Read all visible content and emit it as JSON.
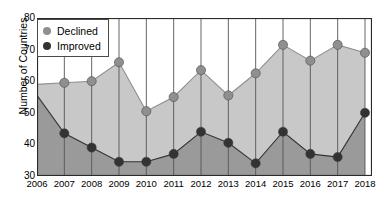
{
  "chart_data": {
    "type": "area",
    "title": "",
    "xlabel": "",
    "ylabel": "Number of Countries",
    "categories": [
      "2006",
      "2007",
      "2008",
      "2009",
      "2010",
      "2011",
      "2012",
      "2013",
      "2014",
      "2015",
      "2016",
      "2017",
      "2018"
    ],
    "x": [
      2006,
      2007,
      2008,
      2009,
      2010,
      2011,
      2012,
      2013,
      2014,
      2015,
      2016,
      2017,
      2018
    ],
    "ylim": [
      30,
      80
    ],
    "yticks": [
      30,
      40,
      50,
      60,
      70,
      80
    ],
    "grid": "vertical-only",
    "legend_position": "top-left",
    "series": [
      {
        "name": "Declined",
        "color": "#8f8f8f",
        "fill_color": "#c8c8c8",
        "values": [
          59,
          59.5,
          60,
          66,
          50.5,
          55,
          63.5,
          55.5,
          62.5,
          71.5,
          66.5,
          71.5,
          69
        ],
        "markers_shown_from": 2007
      },
      {
        "name": "Improved",
        "color": "#333333",
        "fill_color": "#9a9a9a",
        "values": [
          55.5,
          43.5,
          39,
          34.5,
          34.5,
          37,
          44,
          40.5,
          34,
          44,
          37,
          36,
          50
        ],
        "markers_shown_from": 2007
      }
    ]
  },
  "legend": {
    "items": [
      {
        "label": "Declined",
        "color": "#8f8f8f"
      },
      {
        "label": "Improved",
        "color": "#333333"
      }
    ]
  },
  "axes": {
    "y_title": "Number of Countries",
    "y_tick_labels": [
      "80",
      "70",
      "60",
      "50",
      "40",
      "30"
    ],
    "x_tick_labels": [
      "2006",
      "2007",
      "2008",
      "2009",
      "2010",
      "2011",
      "2012",
      "2013",
      "2014",
      "2015",
      "2016",
      "2017",
      "2018"
    ]
  }
}
